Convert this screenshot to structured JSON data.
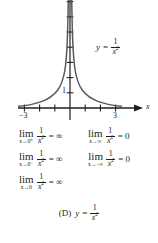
{
  "figure": {
    "caption_id": "(D)",
    "caption_lhs": "y",
    "caption_eq": "=",
    "caption_num": "1",
    "caption_den": "x",
    "caption_den_exp": "2"
  },
  "graph": {
    "x_axis_label": "x",
    "x_tick_label_left": "−3",
    "x_tick_label_right": "3",
    "y_tick_label": "1",
    "curve_label": {
      "lhs": "y",
      "eq": "=",
      "num": "1",
      "den": "x",
      "den_exp": "2"
    },
    "xlim": [
      -3.7,
      3.7
    ],
    "ylim": [
      -0.45,
      6.6
    ],
    "x_ticks": [
      -3,
      -2,
      -1,
      1,
      2,
      3
    ],
    "y_ticks": [
      1,
      2,
      3,
      4,
      5,
      6
    ],
    "labeled_x_ticks": [
      -3,
      3
    ],
    "labeled_y_ticks": [
      1
    ],
    "function": "1/x^2",
    "axis_color": "#231f20",
    "curve_color": "#58595b"
  },
  "limits": [
    {
      "op": "lim",
      "sub": "x→0⁺",
      "num": "1",
      "den": "x",
      "den_exp": "2",
      "eq": "= ∞",
      "column": "left",
      "row": 1
    },
    {
      "op": "lim",
      "sub": "x→∞",
      "num": "1",
      "den": "x",
      "den_exp": "2",
      "eq": "= 0",
      "column": "right",
      "row": 1
    },
    {
      "op": "lim",
      "sub": "x→0⁻",
      "num": "1",
      "den": "x",
      "den_exp": "2",
      "eq": "= ∞",
      "column": "left",
      "row": 2
    },
    {
      "op": "lim",
      "sub": "x→−∞",
      "num": "1",
      "den": "x",
      "den_exp": "2",
      "eq": "= 0",
      "column": "right",
      "row": 2
    },
    {
      "op": "lim",
      "sub": "x→0",
      "num": "1",
      "den": "x",
      "den_exp": "2",
      "eq": "= ∞",
      "column": "left",
      "row": 3
    }
  ]
}
